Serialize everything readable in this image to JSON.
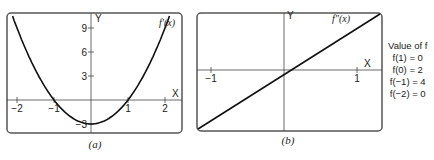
{
  "chart_data": [
    {
      "type": "line",
      "panel": "a",
      "caption": "(a)",
      "curve_label": "f′(x)",
      "function": "3x^2 - 3",
      "x": [
        -2.3,
        -2,
        -1.5,
        -1,
        -0.5,
        0,
        0.5,
        1,
        1.5,
        2,
        2.3
      ],
      "y": [
        12.87,
        9,
        3.75,
        0,
        -2.25,
        -3,
        -2.25,
        0,
        3.75,
        9,
        12.87
      ],
      "xlim": [
        -2.4,
        2.4
      ],
      "ylim": [
        -4,
        11.5
      ],
      "xticks": [
        -2,
        -1,
        1,
        2
      ],
      "xtick_labels": [
        "−2",
        "−1",
        "1",
        "2"
      ],
      "yticks": [
        9,
        6,
        3,
        -3
      ],
      "ytick_labels": [
        "9",
        "6",
        "3",
        "−3"
      ],
      "xlabel": "X",
      "ylabel": "Y"
    },
    {
      "type": "line",
      "panel": "b",
      "caption": "(b)",
      "curve_label": "f″(x)",
      "function": "6x",
      "x": [
        -1.15,
        1.15
      ],
      "y": [
        -6.9,
        6.9
      ],
      "xlim": [
        -1.15,
        1.15
      ],
      "ylim": [
        -6.9,
        6.9
      ],
      "xticks": [
        -1,
        1
      ],
      "xtick_labels": [
        "−1",
        "1"
      ],
      "xlabel": "X",
      "ylabel": "Y"
    }
  ],
  "values_table": {
    "title": "Value of f",
    "rows": [
      "f(1) = 0",
      "f(0) = 2",
      "f(−1) = 4",
      "f(−2) = 0"
    ]
  }
}
